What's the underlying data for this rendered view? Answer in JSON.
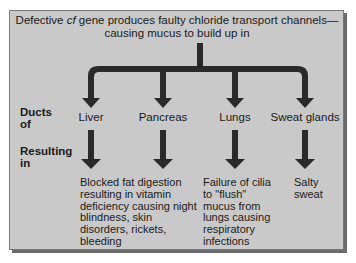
{
  "header": {
    "line1_pre": "Defective ",
    "line1_italic": "cf",
    "line1_post": " gene produces faulty chloride transport channels—",
    "line2": "causing mucus to build up in"
  },
  "row_labels": {
    "ducts": "Ducts\nof",
    "resulting": "Resulting\nin"
  },
  "organs": [
    {
      "name": "Liver",
      "result": "Blocked fat digestion\nresulting in vitamin\ndeficiency causing night\nblindness, skin\ndisorders, rickets,\nbleeding"
    },
    {
      "name": "Pancreas",
      "result": ""
    },
    {
      "name": "Lungs",
      "result": "Failure of cilia\nto \"flush\"\nmucus from\nlungs causing\nrespiratory\ninfections"
    },
    {
      "name": "Sweat glands",
      "result": "Salty\nsweat"
    }
  ],
  "colors": {
    "panel": "#c9c9c9",
    "arrow": "#2a2a2a",
    "border": "#7a7a7a"
  }
}
